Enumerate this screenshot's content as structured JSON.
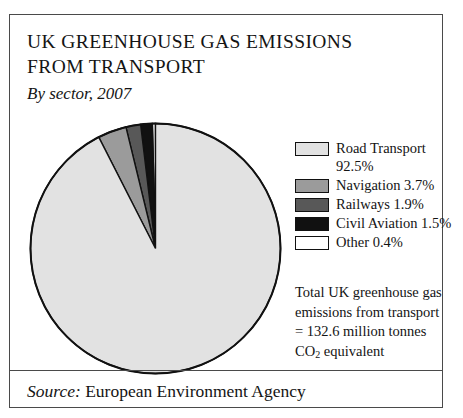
{
  "figure": {
    "title_lines": [
      "UK GREENHOUSE GAS EMISSIONS",
      "FROM TRANSPORT"
    ],
    "subtitle": "By sector, 2007",
    "source_label": "Source:",
    "source_value": "European Environment Agency",
    "note_lines": [
      "Total UK greenhouse gas",
      "emissions from transport",
      "= 132.6 million tonnes"
    ],
    "note_final_prefix": "CO",
    "note_final_sub": "2",
    "note_final_suffix": " equivalent"
  },
  "chart_data": {
    "type": "pie",
    "title": "UK GREENHOUSE GAS EMISSIONS FROM TRANSPORT",
    "subtitle": "By sector, 2007",
    "unit": "%",
    "total_label": "Total UK greenhouse gas emissions from transport = 132.6 million tonnes CO2 equivalent",
    "total_value": 132.6,
    "total_unit": "million tonnes CO2 equivalent",
    "legend_position": "right",
    "start_angle_deg": 0,
    "direction": "counterclockwise",
    "categories": [
      "Road Transport",
      "Navigation",
      "Railways",
      "Civil Aviation",
      "Other"
    ],
    "values": [
      92.5,
      3.7,
      1.9,
      1.5,
      0.4
    ],
    "colors": [
      "#e2e2e2",
      "#9b9b9b",
      "#585858",
      "#111111",
      "#ffffff"
    ],
    "slices": [
      {
        "label": "Road Transport",
        "value": 92.5,
        "display": "Road Transport",
        "pct_text": "92.5%",
        "color": "#e2e2e2",
        "wrap": true
      },
      {
        "label": "Navigation",
        "value": 3.7,
        "display": "Navigation 3.7%",
        "color": "#9b9b9b",
        "wrap": false
      },
      {
        "label": "Railways",
        "value": 1.9,
        "display": "Railways 1.9%",
        "color": "#585858",
        "wrap": false
      },
      {
        "label": "Civil Aviation",
        "value": 1.5,
        "display": "Civil Aviation 1.5%",
        "color": "#111111",
        "wrap": false
      },
      {
        "label": "Other",
        "value": 0.4,
        "display": "Other 0.4%",
        "color": "#ffffff",
        "wrap": false
      }
    ]
  }
}
